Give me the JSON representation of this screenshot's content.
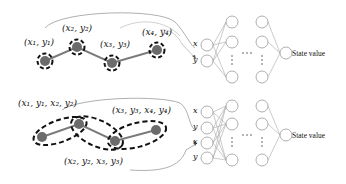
{
  "top_panel": {
    "point_labels": [
      "(x₁, y₁)",
      "(x₂, y₂)",
      "(x₃, y₃)",
      "(x₄, y₄)"
    ],
    "network": {
      "inputs": [
        "x",
        "y"
      ],
      "output_label": "State value",
      "ellipsis": "⋯"
    }
  },
  "bottom_panel": {
    "segment_labels": [
      "(x₁, y₁, x₂, y₂)",
      "(x₂, y₂, x₃, y₃)",
      "(x₃, y₃, x₄, y₄)"
    ],
    "network": {
      "inputs": [
        "x",
        "y",
        "x",
        "y"
      ],
      "output_label": "State value",
      "ellipsis": "⋯"
    }
  },
  "colors": {
    "point_fill": "#6b6b6b",
    "trajectory_line": "#7a7a7a",
    "dashed_outline": "#111111",
    "neuron_stroke": "#9a9a9a",
    "connection": "#a8a8a8",
    "bracket_curve": "#9a9a9a"
  }
}
